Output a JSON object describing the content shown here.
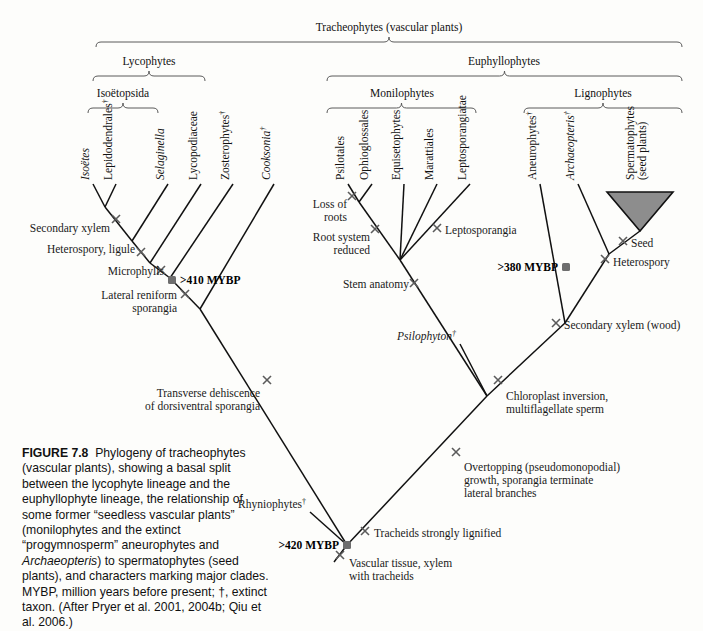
{
  "figure": {
    "number": "FIGURE 7.8",
    "caption": "Phylogeny of tracheophytes (vascular plants), showing a basal split between the lycophyte lineage and the euphyllophyte lineage, the relationship of some former “seedless vascular plants” (monilophytes and the extinct “progymnosperm” aneurophytes and Archaeopteris) to spermatophytes (seed plants), and characters marking major clades. MYBP, million years before present; †, extinct taxon. (After Pryer et al. 2001, 2004b; Qiu et al. 2006.)",
    "caption_italic_word": "Archaeopteris"
  },
  "colors": {
    "background": "#fdfdfb",
    "branch": "#111111",
    "bracket": "#5a5a5a",
    "mark": "#5b5b5b",
    "node_dot": "#6e6e6e",
    "clade_triangle_fill": "#8d8d8d"
  },
  "brackets": [
    {
      "id": "tracheophytes",
      "label": "Tracheophytes (vascular plants)",
      "x1": 96,
      "x2": 682,
      "y": 42,
      "label_x": 389,
      "label_y": 31
    },
    {
      "id": "lycophytes",
      "label": "Lycophytes",
      "x1": 93,
      "x2": 205,
      "y": 76,
      "label_x": 149,
      "label_y": 65
    },
    {
      "id": "euphyllophytes",
      "label": "Euphyllophytes",
      "x1": 327,
      "x2": 682,
      "y": 76,
      "label_x": 504,
      "label_y": 65
    },
    {
      "id": "isoetopsida",
      "label": "Isoëtopsida",
      "x1": 88,
      "x2": 158,
      "y": 108,
      "label_x": 123,
      "label_y": 97
    },
    {
      "id": "monilophytes",
      "label": "Monilophytes",
      "x1": 327,
      "x2": 476,
      "y": 108,
      "label_x": 402,
      "label_y": 97
    },
    {
      "id": "lignophytes",
      "label": "Lignophytes",
      "x1": 524,
      "x2": 682,
      "y": 108,
      "label_x": 603,
      "label_y": 97
    }
  ],
  "taxa": [
    {
      "id": "isoetes",
      "label": "Isoëtes",
      "italic": true,
      "dagger": false,
      "x": 93,
      "y": 184,
      "label_x": 89,
      "label_y": 180
    },
    {
      "id": "lepidodendrales",
      "label": "Lepidodendrales",
      "italic": false,
      "dagger": true,
      "x": 116,
      "y": 184,
      "label_x": 112,
      "label_y": 180
    },
    {
      "id": "selaginella",
      "label": "Selaginella",
      "italic": true,
      "dagger": false,
      "x": 168,
      "y": 184,
      "label_x": 164,
      "label_y": 180
    },
    {
      "id": "lycopodiaceae",
      "label": "Lycopodiaceae",
      "italic": false,
      "dagger": false,
      "x": 201,
      "y": 184,
      "label_x": 197,
      "label_y": 180
    },
    {
      "id": "zosterophytes",
      "label": "Zosterophytes",
      "italic": false,
      "dagger": true,
      "x": 233,
      "y": 184,
      "label_x": 229,
      "label_y": 180
    },
    {
      "id": "cooksonia",
      "label": "Cooksonia",
      "italic": true,
      "dagger": true,
      "x": 274,
      "y": 184,
      "label_x": 270,
      "label_y": 180
    },
    {
      "id": "psilotales",
      "label": "Psilotales",
      "italic": false,
      "dagger": false,
      "x": 348,
      "y": 184,
      "label_x": 344,
      "label_y": 180
    },
    {
      "id": "ophioglossales",
      "label": "Ophioglossales",
      "italic": false,
      "dagger": false,
      "x": 372,
      "y": 184,
      "label_x": 368,
      "label_y": 180
    },
    {
      "id": "equisetophytes",
      "label": "Equisetophytes",
      "italic": false,
      "dagger": false,
      "x": 404,
      "y": 184,
      "label_x": 400,
      "label_y": 180
    },
    {
      "id": "marattiales",
      "label": "Marattiales",
      "italic": false,
      "dagger": false,
      "x": 437,
      "y": 184,
      "label_x": 433,
      "label_y": 180
    },
    {
      "id": "leptosporangiatae",
      "label": "Leptosporangiatae",
      "italic": false,
      "dagger": false,
      "x": 470,
      "y": 184,
      "label_x": 466,
      "label_y": 180
    },
    {
      "id": "aneurophytes",
      "label": "Aneurophytes",
      "italic": false,
      "dagger": true,
      "x": 540,
      "y": 184,
      "label_x": 536,
      "label_y": 180
    },
    {
      "id": "archaeopteris",
      "label": "Archaeopteris",
      "italic": true,
      "dagger": true,
      "x": 578,
      "y": 184,
      "label_x": 574,
      "label_y": 180
    },
    {
      "id": "spermatophytes",
      "label": "Spermatophytes",
      "label2": "(seed plants)",
      "italic": false,
      "dagger": false,
      "x": 640,
      "y": 184,
      "label_x": 634,
      "label_y": 180
    }
  ],
  "clade_triangle": {
    "id": "spermatophytes-clade",
    "left_x": 607,
    "right_x": 673,
    "top_y": 192,
    "apex_x": 640,
    "apex_y": 231
  },
  "branches": [
    {
      "id": "br-isoetes",
      "x1": 93,
      "y1": 184,
      "x2": 105,
      "y2": 207
    },
    {
      "id": "br-lepidodendrales",
      "x1": 116,
      "y1": 184,
      "x2": 105,
      "y2": 207
    },
    {
      "id": "br-isoetopsida-stem",
      "x1": 105,
      "y1": 207,
      "x2": 132,
      "y2": 241
    },
    {
      "id": "br-selaginella",
      "x1": 168,
      "y1": 184,
      "x2": 132,
      "y2": 241
    },
    {
      "id": "br-ligule-stem",
      "x1": 132,
      "y1": 241,
      "x2": 150,
      "y2": 263
    },
    {
      "id": "br-lycopodiaceae",
      "x1": 201,
      "y1": 184,
      "x2": 150,
      "y2": 263
    },
    {
      "id": "br-microphyll-stem",
      "x1": 150,
      "y1": 263,
      "x2": 170,
      "y2": 278
    },
    {
      "id": "br-zosterophytes",
      "x1": 233,
      "y1": 184,
      "x2": 170,
      "y2": 278
    },
    {
      "id": "br-lyco-stem",
      "x1": 170,
      "y1": 278,
      "x2": 200,
      "y2": 309
    },
    {
      "id": "br-cooksonia",
      "x1": 274,
      "y1": 184,
      "x2": 200,
      "y2": 309
    },
    {
      "id": "br-lyco-lineage",
      "x1": 200,
      "y1": 309,
      "x2": 347,
      "y2": 545
    },
    {
      "id": "br-psilotales",
      "x1": 348,
      "y1": 184,
      "x2": 359,
      "y2": 202
    },
    {
      "id": "br-ophioglossales",
      "x1": 372,
      "y1": 184,
      "x2": 359,
      "y2": 202
    },
    {
      "id": "br-psilot-stem",
      "x1": 359,
      "y1": 202,
      "x2": 400,
      "y2": 260
    },
    {
      "id": "br-equisetophytes",
      "x1": 404,
      "y1": 184,
      "x2": 400,
      "y2": 260
    },
    {
      "id": "br-marattiales",
      "x1": 437,
      "y1": 184,
      "x2": 400,
      "y2": 260
    },
    {
      "id": "br-leptosporangiatae",
      "x1": 470,
      "y1": 184,
      "x2": 400,
      "y2": 260
    },
    {
      "id": "br-monilo-stem",
      "x1": 400,
      "y1": 260,
      "x2": 487,
      "y2": 396
    },
    {
      "id": "br-psilophyton",
      "x1": 460,
      "y1": 344,
      "x2": 487,
      "y2": 396
    },
    {
      "id": "br-aneurophytes",
      "x1": 540,
      "y1": 184,
      "x2": 565,
      "y2": 323
    },
    {
      "id": "br-archaeopteris",
      "x1": 578,
      "y1": 184,
      "x2": 609,
      "y2": 254
    },
    {
      "id": "br-spermatophytes",
      "x1": 640,
      "y1": 231,
      "x2": 609,
      "y2": 254
    },
    {
      "id": "br-seed-stem",
      "x1": 609,
      "y1": 254,
      "x2": 565,
      "y2": 323
    },
    {
      "id": "br-ligno-stem",
      "x1": 565,
      "y1": 323,
      "x2": 487,
      "y2": 396
    },
    {
      "id": "br-euphyllo-lineage",
      "x1": 487,
      "y1": 396,
      "x2": 347,
      "y2": 545
    },
    {
      "id": "br-rhyniophytes",
      "x1": 310,
      "y1": 512,
      "x2": 347,
      "y2": 545
    },
    {
      "id": "br-root",
      "x1": 347,
      "y1": 545,
      "x2": 334,
      "y2": 562
    }
  ],
  "marks": [
    {
      "id": "mark-secondary-xylem-lyco",
      "x": 116,
      "y": 219
    },
    {
      "id": "mark-heterospory-ligule",
      "x": 141,
      "y": 252
    },
    {
      "id": "mark-microphylls",
      "x": 161,
      "y": 270
    },
    {
      "id": "mark-lateral-reniform",
      "x": 185,
      "y": 294
    },
    {
      "id": "mark-transverse-dehiscence",
      "x": 267,
      "y": 380
    },
    {
      "id": "mark-loss-of-roots",
      "x": 352,
      "y": 196
    },
    {
      "id": "mark-root-system-reduced",
      "x": 375,
      "y": 229
    },
    {
      "id": "mark-leptosporangia",
      "x": 437,
      "y": 228
    },
    {
      "id": "mark-stem-anatomy",
      "x": 414,
      "y": 283
    },
    {
      "id": "mark-chloroplast-inversion",
      "x": 498,
      "y": 380
    },
    {
      "id": "mark-overtopping",
      "x": 456,
      "y": 452
    },
    {
      "id": "mark-tracheids-lignified",
      "x": 365,
      "y": 531
    },
    {
      "id": "mark-vascular-tissue",
      "x": 340,
      "y": 555
    },
    {
      "id": "mark-seed",
      "x": 623,
      "y": 241
    },
    {
      "id": "mark-heterospory-seed",
      "x": 605,
      "y": 259
    },
    {
      "id": "mark-secondary-xylem-wood",
      "x": 556,
      "y": 323
    }
  ],
  "nodes": [
    {
      "id": "node-410",
      "x": 172,
      "y": 280
    },
    {
      "id": "node-380",
      "x": 566,
      "y": 267
    },
    {
      "id": "node-420",
      "x": 347,
      "y": 545
    }
  ],
  "characters": [
    {
      "id": "secondary-xylem-lyco",
      "lines": [
        "Secondary xylem"
      ],
      "x": 110,
      "y": 232,
      "anchor": "end"
    },
    {
      "id": "heterospory-ligule",
      "lines": [
        "Heterospory, ligule"
      ],
      "x": 135,
      "y": 253,
      "anchor": "end"
    },
    {
      "id": "microphylls",
      "lines": [
        "Microphylls"
      ],
      "x": 164,
      "y": 275,
      "anchor": "end"
    },
    {
      "id": "lateral-reniform",
      "lines": [
        "Lateral reniform",
        "sporangia"
      ],
      "x": 177,
      "y": 299,
      "anchor": "end"
    },
    {
      "id": "transverse-dehiscence",
      "lines": [
        "Transverse dehiscence",
        "of dorsiventral sporangia"
      ],
      "x": 260,
      "y": 397,
      "anchor": "end"
    },
    {
      "id": "loss-of-roots",
      "lines": [
        "Loss of",
        "roots"
      ],
      "x": 347,
      "y": 208,
      "anchor": "end"
    },
    {
      "id": "root-system-reduced",
      "lines": [
        "Root system",
        "reduced"
      ],
      "x": 370,
      "y": 241,
      "anchor": "end"
    },
    {
      "id": "stem-anatomy",
      "lines": [
        "Stem anatomy"
      ],
      "x": 409,
      "y": 288,
      "anchor": "end"
    },
    {
      "id": "leptosporangia",
      "lines": [
        "Leptosporangia"
      ],
      "x": 445,
      "y": 234,
      "anchor": "start"
    },
    {
      "id": "chloroplast-inversion",
      "lines": [
        "Chloroplast inversion,",
        "multiflagellate sperm"
      ],
      "x": 506,
      "y": 400,
      "anchor": "start"
    },
    {
      "id": "overtopping",
      "lines": [
        "Overtopping (pseudomonopodial)",
        "growth, sporangia terminate",
        "lateral branches"
      ],
      "x": 464,
      "y": 471,
      "anchor": "start"
    },
    {
      "id": "tracheids-lignified",
      "lines": [
        "Tracheids strongly lignified"
      ],
      "x": 374,
      "y": 537,
      "anchor": "start"
    },
    {
      "id": "vascular-tissue",
      "lines": [
        "Vascular tissue, xylem",
        "with tracheids"
      ],
      "x": 349,
      "y": 567,
      "anchor": "start"
    },
    {
      "id": "seed",
      "lines": [
        "Seed"
      ],
      "x": 631,
      "y": 247,
      "anchor": "start"
    },
    {
      "id": "heterospory-seed",
      "lines": [
        "Heterospory"
      ],
      "x": 613,
      "y": 266,
      "anchor": "start"
    },
    {
      "id": "secondary-xylem-wood",
      "lines": [
        "Secondary xylem (wood)"
      ],
      "x": 564,
      "y": 329,
      "anchor": "start"
    },
    {
      "id": "psilophyton",
      "lines": [
        "Psilophyton†"
      ],
      "x": 456,
      "y": 340,
      "anchor": "end",
      "italic": true
    },
    {
      "id": "rhyniophytes",
      "lines": [
        "Rhyniophytes†"
      ],
      "x": 306,
      "y": 508,
      "anchor": "end"
    }
  ],
  "mybp_labels": [
    {
      "id": "mybp-410",
      "text": ">410 MYBP",
      "x": 180,
      "y": 284,
      "anchor": "start"
    },
    {
      "id": "mybp-380",
      "text": ">380 MYBP",
      "x": 558,
      "y": 271,
      "anchor": "end"
    },
    {
      "id": "mybp-420",
      "text": ">420 MYBP",
      "x": 339,
      "y": 549,
      "anchor": "end"
    }
  ],
  "chart_data": {
    "type": "diagram",
    "diagram_kind": "cladogram",
    "title": "Phylogeny of tracheophytes (vascular plants)",
    "terminal_taxa": [
      "Isoëtes",
      "Lepidodendrales†",
      "Selaginella",
      "Lycopodiaceae",
      "Zosterophytes†",
      "Cooksonia†",
      "Psilotales",
      "Ophioglossales",
      "Equisetophytes",
      "Marattiales",
      "Leptosporangiatae",
      "Aneurophytes†",
      "Archaeopteris†",
      "Spermatophytes (seed plants)",
      "Psilophyton†",
      "Rhyniophytes†"
    ],
    "named_clades": [
      "Tracheophytes (vascular plants)",
      "Lycophytes",
      "Euphyllophytes",
      "Isoëtopsida",
      "Monilophytes",
      "Lignophytes"
    ],
    "time_calibrations": [
      ">420 MYBP",
      ">410 MYBP",
      ">380 MYBP"
    ],
    "character_states": [
      "Secondary xylem",
      "Heterospory, ligule",
      "Microphylls",
      "Lateral reniform sporangia",
      "Transverse dehiscence of dorsiventral sporangia",
      "Loss of roots",
      "Root system reduced",
      "Leptosporangia",
      "Stem anatomy",
      "Chloroplast inversion, multiflagellate sperm",
      "Overtopping (pseudomonopodial) growth, sporangia terminate lateral branches",
      "Tracheids strongly lignified",
      "Vascular tissue, xylem with tracheids",
      "Seed",
      "Heterospory",
      "Secondary xylem (wood)"
    ]
  }
}
